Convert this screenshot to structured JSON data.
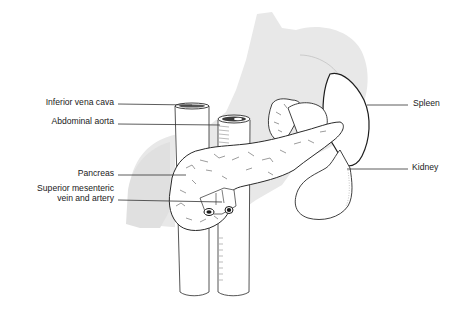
{
  "figure": {
    "labels": {
      "inferior_vena_cava": "Inferior vena cava",
      "abdominal_aorta": "Abdominal aorta",
      "pancreas": "Pancreas",
      "sma_line1": "Superior mesenteric",
      "sma_line2": "vein and artery",
      "spleen": "Spleen",
      "kidney": "Kidney"
    },
    "colors": {
      "background": "#ffffff",
      "shadow_organs": "#e6e6e6",
      "outline": "#2a2a2a",
      "leader_line": "#333333",
      "text": "#1a1a1a"
    }
  }
}
